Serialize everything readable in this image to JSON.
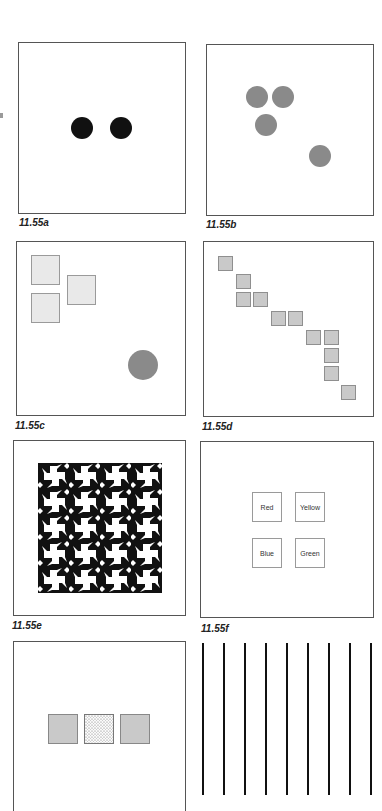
{
  "figure": {
    "panels": [
      {
        "id": "a",
        "caption": "11.55a",
        "description": "Two black dots side by side",
        "elements": [
          {
            "type": "circle",
            "fill": "#111111"
          },
          {
            "type": "circle",
            "fill": "#111111"
          }
        ]
      },
      {
        "id": "b",
        "caption": "11.55b",
        "description": "Three gray circles clustered, one gray circle apart",
        "elements": [
          {
            "type": "circle",
            "fill": "#8a8a8a"
          },
          {
            "type": "circle",
            "fill": "#8a8a8a"
          },
          {
            "type": "circle",
            "fill": "#8a8a8a"
          },
          {
            "type": "circle",
            "fill": "#8a8a8a"
          }
        ]
      },
      {
        "id": "c",
        "caption": "11.55c",
        "description": "Three light squares grouped top-left, one gray circle bottom-right",
        "elements": [
          {
            "type": "square",
            "fill": "#e9e9e9"
          },
          {
            "type": "square",
            "fill": "#e9e9e9"
          },
          {
            "type": "square",
            "fill": "#e9e9e9"
          },
          {
            "type": "circle",
            "fill": "#8a8a8a"
          }
        ]
      },
      {
        "id": "d",
        "caption": "11.55d",
        "description": "Gray squares arranged along a diagonal staircase",
        "count": 12
      },
      {
        "id": "e",
        "caption": "11.55e",
        "description": "Black-and-white pinwheel tessellation pattern"
      },
      {
        "id": "f",
        "caption": "11.55f",
        "description": "Four labeled squares",
        "labels": [
          "Red",
          "Yellow",
          "Blue",
          "Green"
        ]
      },
      {
        "id": "g",
        "caption": "",
        "description": "Three squares: gray, dotted, gray",
        "elements": [
          {
            "type": "square",
            "fill": "#c9c9c9"
          },
          {
            "type": "square",
            "fill": "dotted"
          },
          {
            "type": "square",
            "fill": "#c9c9c9"
          }
        ]
      },
      {
        "id": "h",
        "caption": "",
        "description": "Nine evenly spaced vertical black lines",
        "count": 9
      }
    ]
  },
  "colors": {
    "border": "#555555",
    "black": "#111111",
    "gray_circle": "#8a8a8a",
    "light_square": "#e9e9e9",
    "gray_square": "#c9c9c9"
  }
}
